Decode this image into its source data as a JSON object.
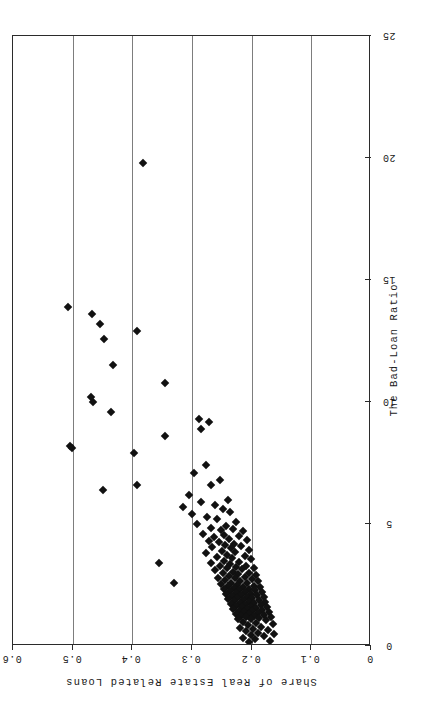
{
  "figure": {
    "orientation": "landscape-rotated",
    "marker": "filled-diamond",
    "marker_color": "#111111",
    "grid_color": "#7d7d7d",
    "frame_color": "#2b2b2b"
  },
  "chart_data": {
    "type": "scatter",
    "title": "",
    "xlabel": "The Bad-Loan Ratio",
    "ylabel": "Share of Real Estate Related Loans",
    "xlim": [
      0,
      25
    ],
    "ylim": [
      0,
      0.6
    ],
    "xticks": [
      0,
      5,
      10,
      15,
      20,
      25
    ],
    "xticklabels": [
      "0",
      "5",
      "10",
      "15",
      "20",
      "25"
    ],
    "yticks": [
      0,
      0.1,
      0.2,
      0.3,
      0.4,
      0.5,
      0.6
    ],
    "yticklabels": [
      "0",
      "0.1",
      "0.2",
      "0.3",
      "0.4",
      "0.5",
      "0.6"
    ],
    "grid": "vertical-at-y-ticks",
    "legend": "none",
    "n_points": 165,
    "points": [
      [
        19.8,
        0.383
      ],
      [
        13.9,
        0.508
      ],
      [
        13.6,
        0.468
      ],
      [
        13.2,
        0.455
      ],
      [
        12.9,
        0.393
      ],
      [
        12.6,
        0.447
      ],
      [
        11.5,
        0.432
      ],
      [
        10.8,
        0.345
      ],
      [
        10.2,
        0.47
      ],
      [
        10.0,
        0.466
      ],
      [
        9.6,
        0.435
      ],
      [
        9.3,
        0.289
      ],
      [
        9.2,
        0.272
      ],
      [
        8.9,
        0.285
      ],
      [
        8.6,
        0.345
      ],
      [
        8.2,
        0.505
      ],
      [
        8.1,
        0.502
      ],
      [
        7.9,
        0.398
      ],
      [
        7.4,
        0.277
      ],
      [
        7.1,
        0.297
      ],
      [
        6.8,
        0.253
      ],
      [
        6.6,
        0.268
      ],
      [
        6.4,
        0.449
      ],
      [
        6.2,
        0.305
      ],
      [
        6.0,
        0.24
      ],
      [
        5.9,
        0.285
      ],
      [
        5.8,
        0.262
      ],
      [
        5.7,
        0.316
      ],
      [
        5.6,
        0.248
      ],
      [
        5.5,
        0.236
      ],
      [
        5.4,
        0.3
      ],
      [
        5.3,
        0.275
      ],
      [
        5.2,
        0.258
      ],
      [
        5.1,
        0.226
      ],
      [
        5.0,
        0.291
      ],
      [
        4.9,
        0.243
      ],
      [
        4.85,
        0.268
      ],
      [
        4.8,
        0.232
      ],
      [
        4.75,
        0.252
      ],
      [
        4.7,
        0.214
      ],
      [
        4.6,
        0.281
      ],
      [
        4.55,
        0.247
      ],
      [
        4.5,
        0.222
      ],
      [
        4.45,
        0.263
      ],
      [
        4.4,
        0.238
      ],
      [
        4.35,
        0.208
      ],
      [
        4.3,
        0.272
      ],
      [
        4.25,
        0.255
      ],
      [
        4.2,
        0.229
      ],
      [
        4.15,
        0.244
      ],
      [
        4.1,
        0.218
      ],
      [
        4.05,
        0.266
      ],
      [
        4.0,
        0.235
      ],
      [
        3.95,
        0.205
      ],
      [
        3.9,
        0.25
      ],
      [
        3.85,
        0.228
      ],
      [
        3.8,
        0.276
      ],
      [
        3.75,
        0.241
      ],
      [
        3.7,
        0.212
      ],
      [
        3.65,
        0.259
      ],
      [
        3.6,
        0.233
      ],
      [
        3.55,
        0.201
      ],
      [
        3.5,
        0.246
      ],
      [
        3.45,
        0.221
      ],
      [
        3.4,
        0.268
      ],
      [
        3.35,
        0.237
      ],
      [
        3.3,
        0.209
      ],
      [
        3.28,
        0.253
      ],
      [
        3.25,
        0.227
      ],
      [
        3.2,
        0.197
      ],
      [
        3.18,
        0.242
      ],
      [
        3.15,
        0.216
      ],
      [
        3.1,
        0.261
      ],
      [
        3.05,
        0.231
      ],
      [
        3.0,
        0.204
      ],
      [
        2.98,
        0.248
      ],
      [
        2.95,
        0.223
      ],
      [
        2.9,
        0.193
      ],
      [
        2.88,
        0.238
      ],
      [
        2.85,
        0.212
      ],
      [
        2.8,
        0.256
      ],
      [
        2.78,
        0.228
      ],
      [
        2.75,
        0.2
      ],
      [
        2.7,
        0.244
      ],
      [
        2.68,
        0.219
      ],
      [
        2.65,
        0.189
      ],
      [
        2.6,
        0.234
      ],
      [
        2.58,
        0.208
      ],
      [
        2.55,
        0.251
      ],
      [
        2.5,
        0.225
      ],
      [
        2.48,
        0.197
      ],
      [
        2.45,
        0.24
      ],
      [
        2.42,
        0.215
      ],
      [
        2.4,
        0.186
      ],
      [
        2.38,
        0.23
      ],
      [
        2.35,
        0.205
      ],
      [
        2.32,
        0.247
      ],
      [
        2.3,
        0.221
      ],
      [
        2.28,
        0.194
      ],
      [
        2.25,
        0.236
      ],
      [
        2.22,
        0.211
      ],
      [
        2.2,
        0.183
      ],
      [
        2.18,
        0.227
      ],
      [
        2.15,
        0.202
      ],
      [
        2.12,
        0.243
      ],
      [
        2.1,
        0.218
      ],
      [
        2.08,
        0.191
      ],
      [
        2.05,
        0.233
      ],
      [
        2.02,
        0.208
      ],
      [
        2.0,
        0.18
      ],
      [
        1.98,
        0.224
      ],
      [
        1.95,
        0.199
      ],
      [
        1.92,
        0.239
      ],
      [
        1.9,
        0.214
      ],
      [
        1.88,
        0.188
      ],
      [
        1.85,
        0.229
      ],
      [
        1.82,
        0.205
      ],
      [
        1.8,
        0.177
      ],
      [
        1.78,
        0.22
      ],
      [
        1.75,
        0.196
      ],
      [
        1.72,
        0.235
      ],
      [
        1.7,
        0.211
      ],
      [
        1.68,
        0.185
      ],
      [
        1.65,
        0.226
      ],
      [
        1.62,
        0.202
      ],
      [
        1.6,
        0.174
      ],
      [
        1.58,
        0.217
      ],
      [
        1.55,
        0.193
      ],
      [
        1.52,
        0.231
      ],
      [
        1.5,
        0.208
      ],
      [
        1.48,
        0.182
      ],
      [
        1.45,
        0.222
      ],
      [
        1.42,
        0.199
      ],
      [
        1.4,
        0.171
      ],
      [
        1.38,
        0.213
      ],
      [
        1.35,
        0.19
      ],
      [
        1.32,
        0.227
      ],
      [
        1.3,
        0.205
      ],
      [
        1.28,
        0.179
      ],
      [
        1.25,
        0.218
      ],
      [
        1.22,
        0.196
      ],
      [
        1.2,
        0.168
      ],
      [
        1.18,
        0.209
      ],
      [
        1.15,
        0.187
      ],
      [
        1.12,
        0.223
      ],
      [
        1.1,
        0.202
      ],
      [
        1.05,
        0.176
      ],
      [
        1.0,
        0.214
      ],
      [
        0.95,
        0.193
      ],
      [
        0.9,
        0.165
      ],
      [
        0.85,
        0.206
      ],
      [
        0.8,
        0.184
      ],
      [
        0.75,
        0.219
      ],
      [
        0.7,
        0.198
      ],
      [
        0.65,
        0.172
      ],
      [
        0.6,
        0.21
      ],
      [
        0.55,
        0.189
      ],
      [
        0.5,
        0.162
      ],
      [
        0.45,
        0.201
      ],
      [
        0.4,
        0.18
      ],
      [
        0.35,
        0.215
      ],
      [
        0.3,
        0.195
      ],
      [
        0.22,
        0.169
      ],
      [
        0.15,
        0.204
      ],
      [
        2.6,
        0.33
      ],
      [
        3.4,
        0.355
      ],
      [
        6.6,
        0.392
      ]
    ]
  }
}
